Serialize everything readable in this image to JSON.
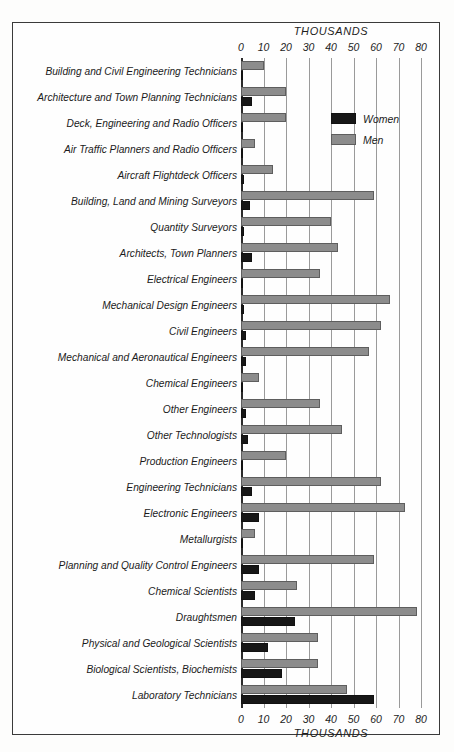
{
  "chart_data": {
    "type": "bar",
    "title": "",
    "orientation": "horizontal",
    "xlabel": "THOUSANDS",
    "ylabel": "",
    "xlim": [
      0,
      80
    ],
    "xticks": [
      0,
      10,
      20,
      30,
      40,
      50,
      60,
      70,
      80
    ],
    "xtick_labels": [
      "0",
      "10",
      "20",
      "30",
      "40",
      "50",
      "60",
      "70",
      "80"
    ],
    "grid": true,
    "legend_position": "top-right",
    "axis_title_top": "THOUSANDS",
    "axis_title_bottom": "THOUSANDS",
    "colors": {
      "women": "#171717",
      "men": "#8c8c8c"
    },
    "categories": [
      "Building and Civil Engineering Technicians",
      "Architecture and Town Planning Technicians",
      "Deck, Engineering and Radio Officers",
      "Air Traffic Planners and Radio Officers",
      "Aircraft Flightdeck Officers",
      "Building, Land and Mining Surveyors",
      "Quantity Surveyors",
      "Architects, Town Planners",
      "Electrical Engineers",
      "Mechanical Design Engineers",
      "Civil Engineers",
      "Mechanical and Aeronautical Engineers",
      "Chemical Engineers",
      "Other Engineers",
      "Other Technologists",
      "Production Engineers",
      "Engineering Technicians",
      "Electronic Engineers",
      "Metallurgists",
      "Planning and Quality Control Engineers",
      "Chemical Scientists",
      "Draughtsmen",
      "Physical and Geological Scientists",
      "Biological Scientists, Biochemists",
      "Laboratory Technicians"
    ],
    "series": [
      {
        "name": "Men",
        "color": "#8c8c8c",
        "values": [
          10,
          20,
          20,
          6,
          14,
          59,
          40,
          43,
          35,
          66,
          62,
          57,
          8,
          35,
          45,
          20,
          62,
          73,
          6,
          59,
          25,
          78,
          34,
          34,
          47
        ]
      },
      {
        "name": "Women",
        "color": "#171717",
        "values": [
          0.8,
          5,
          0.8,
          0.8,
          1.2,
          4,
          1.5,
          5,
          0.8,
          1.5,
          2,
          2,
          1,
          2,
          3,
          1,
          5,
          8,
          0.8,
          8,
          6,
          24,
          12,
          18,
          59
        ]
      }
    ]
  },
  "legend": {
    "items": [
      {
        "label": "Women",
        "swatch": "women"
      },
      {
        "label": "Men",
        "swatch": "men"
      }
    ]
  }
}
